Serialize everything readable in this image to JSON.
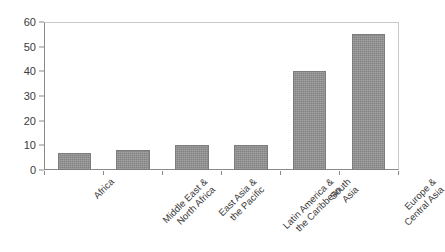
{
  "chart_data": {
    "type": "bar",
    "title": "",
    "subtitle": "",
    "xlabel": "",
    "ylabel": "",
    "categories": [
      "Africa",
      "Middle East & North Africa",
      "East Asia & the Pacific",
      "Latin America & the Caribbean",
      "South Asia",
      "Europe & Central Asia"
    ],
    "values": [
      7,
      8,
      10,
      10,
      40,
      55
    ],
    "ylim": [
      0,
      60
    ],
    "yticks": [
      0,
      10,
      20,
      30,
      40,
      50,
      60
    ],
    "grid": false,
    "legend": false,
    "legend_position": "none",
    "series": [
      {
        "name": "",
        "values": [
          7,
          8,
          10,
          10,
          40,
          55
        ]
      }
    ]
  },
  "axes": {
    "y_tick_labels": [
      "60",
      "50",
      "40",
      "30",
      "20",
      "10",
      "0"
    ],
    "x_tick_label_lines": [
      [
        "Africa"
      ],
      [
        "Middle East &",
        "North Africa"
      ],
      [
        "East Asia &",
        "the Pacific"
      ],
      [
        "Latin America &",
        "the Caribbean"
      ],
      [
        "South",
        "Asia"
      ],
      [
        "Europe &",
        "Central Asia"
      ]
    ]
  },
  "colors": {
    "bar_fill": "#8e8e8e",
    "bar_outline": "#7c7c7c",
    "axis_line": "#8a8a8a",
    "frame_line": "#c9c9c9",
    "text": "#3a3a3a",
    "background": "#ffffff"
  }
}
